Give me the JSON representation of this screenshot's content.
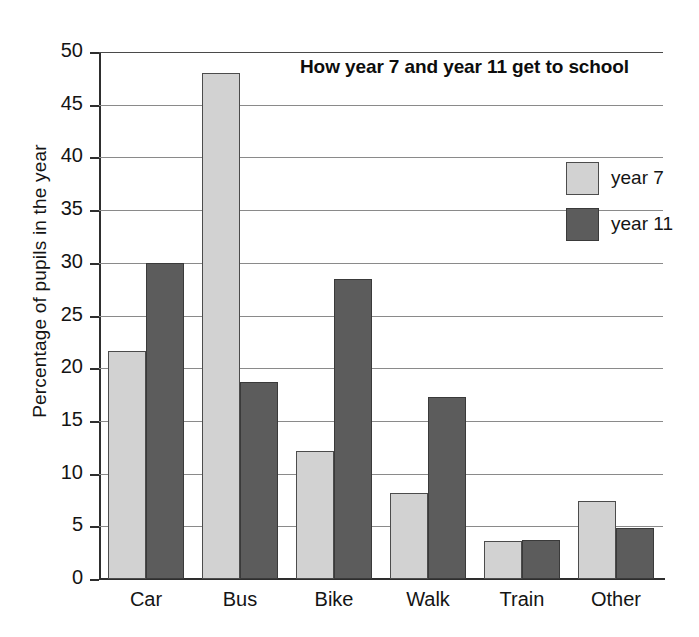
{
  "chart_data": {
    "type": "bar",
    "title": "How year 7 and year 11 get to school",
    "xlabel": "",
    "ylabel": "Percentage of pupils in the year",
    "categories": [
      "Car",
      "Bus",
      "Bike",
      "Walk",
      "Train",
      "Other"
    ],
    "series": [
      {
        "name": "year 7",
        "color": "#d2d2d2",
        "values": [
          21.6,
          48.0,
          12.1,
          8.2,
          3.6,
          7.4
        ]
      },
      {
        "name": "year 11",
        "color": "#5c5c5c",
        "values": [
          30.0,
          18.7,
          28.5,
          17.3,
          3.7,
          4.8
        ]
      }
    ],
    "ylim": [
      0,
      50
    ],
    "yticks": [
      0,
      5,
      10,
      15,
      20,
      25,
      30,
      35,
      40,
      45,
      50
    ],
    "ytick_labels": [
      "0",
      "5",
      "10",
      "15",
      "20",
      "25",
      "30",
      "35",
      "40",
      "45",
      "50"
    ],
    "grid": "horizontal",
    "legend_position": "upper-right-inside"
  }
}
